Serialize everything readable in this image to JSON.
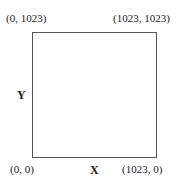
{
  "diagram": {
    "type": "coordinate-square",
    "corners": {
      "top_left": "(0, 1023)",
      "top_right": "(1023, 1023)",
      "bottom_left": "(0, 0)",
      "bottom_right": "(1023, 0)"
    },
    "axes": {
      "x_label": "X",
      "y_label": "Y"
    },
    "colors": {
      "border": "#555555",
      "text": "#222222",
      "background": "#ffffff"
    }
  }
}
